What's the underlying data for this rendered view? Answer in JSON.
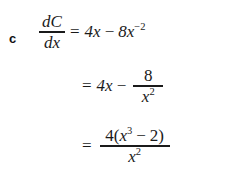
{
  "document": {
    "type": "math-solution",
    "part_label": "c",
    "background_color": "#ffffff",
    "text_color": "#1a1a1a"
  },
  "equations": {
    "line1": {
      "lhs": {
        "numerator": "dC",
        "denominator": "dx"
      },
      "equals": "=",
      "term1": "4x",
      "operator": "−",
      "term2_base": "8x",
      "term2_exponent": "−2"
    },
    "line2": {
      "equals": "=",
      "term1": "4x",
      "operator": "−",
      "fraction": {
        "numerator": "8",
        "denominator_base": "x",
        "denominator_exponent": "2"
      }
    },
    "line3": {
      "equals": "=",
      "fraction": {
        "numerator_lead": "4(",
        "numerator_base": "x",
        "numerator_exponent": "3",
        "numerator_operator": "−",
        "numerator_tail": "2)",
        "denominator_base": "x",
        "denominator_exponent": "2"
      }
    }
  }
}
